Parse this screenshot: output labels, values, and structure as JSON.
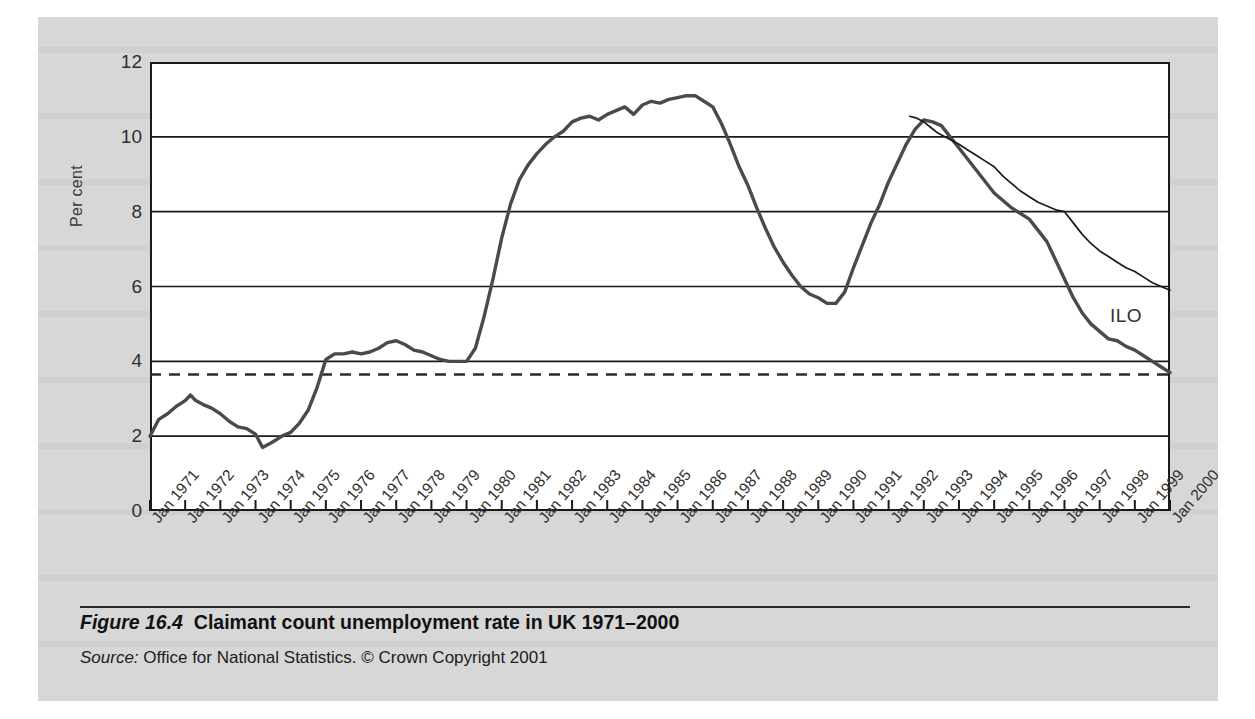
{
  "figure": {
    "number": "Figure 16.4",
    "title": "Claimant count unemployment rate in UK 1971–2000",
    "source_word": "Source:",
    "source_text": "Office for National Statistics. © Crown Copyright 2001"
  },
  "colors": {
    "panel_background": "#d7d7d7",
    "plot_background": "#ffffff",
    "axis": "#1a1a1a",
    "claimant_line": "#4a4a4a",
    "ilo_line": "#1a1a1a",
    "dashed_reference": "#2b2b2b"
  },
  "annotations": {
    "ilo_label": "ILO"
  },
  "chart_data": {
    "type": "line",
    "title": "Claimant count unemployment rate in UK 1971–2000",
    "xlabel": "",
    "ylabel": "Per cent",
    "ylim": [
      0,
      12
    ],
    "yticks": [
      0,
      2,
      4,
      6,
      8,
      10,
      12
    ],
    "ytick_labels": [
      "0",
      "2",
      "4",
      "6",
      "8",
      "10",
      "12"
    ],
    "grid": "horizontal",
    "legend_position": "inline-annotation",
    "xlim": [
      "Jan 1971",
      "Jan 2000"
    ],
    "categories": [
      "Jan 1971",
      "Jan 1972",
      "Jan 1973",
      "Jan 1974",
      "Jan 1975",
      "Jan 1976",
      "Jan 1977",
      "Jan 1978",
      "Jan 1979",
      "Jan 1980",
      "Jan 1981",
      "Jan 1982",
      "Jan 1983",
      "Jan 1984",
      "Jan 1985",
      "Jan 1986",
      "Jan 1987",
      "Jan 1988",
      "Jan 1989",
      "Jan 1990",
      "Jan 1991",
      "Jan 1992",
      "Jan 1993",
      "Jan 1994",
      "Jan 1995",
      "Jan 1996",
      "Jan 1997",
      "Jan 1998",
      "Jan 1999",
      "Jan 2000"
    ],
    "reference_line": {
      "label": "",
      "value": 3.65,
      "style": "dashed"
    },
    "series": [
      {
        "name": "Claimant count",
        "style": "solid-thick",
        "color": "#4a4a4a",
        "x": [
          1971.0,
          1971.25,
          1971.5,
          1971.75,
          1972.0,
          1972.15,
          1972.3,
          1972.5,
          1972.75,
          1973.0,
          1973.25,
          1973.5,
          1973.75,
          1974.0,
          1974.2,
          1974.5,
          1974.75,
          1975.0,
          1975.25,
          1975.5,
          1975.75,
          1976.0,
          1976.25,
          1976.5,
          1976.75,
          1977.0,
          1977.25,
          1977.5,
          1977.75,
          1978.0,
          1978.25,
          1978.5,
          1978.75,
          1979.0,
          1979.25,
          1979.5,
          1979.75,
          1980.0,
          1980.25,
          1980.5,
          1980.75,
          1981.0,
          1981.25,
          1981.5,
          1981.75,
          1982.0,
          1982.25,
          1982.5,
          1982.75,
          1983.0,
          1983.25,
          1983.5,
          1983.75,
          1984.0,
          1984.25,
          1984.5,
          1984.75,
          1985.0,
          1985.25,
          1985.5,
          1985.75,
          1986.0,
          1986.25,
          1986.5,
          1986.75,
          1987.0,
          1987.25,
          1987.5,
          1987.75,
          1988.0,
          1988.25,
          1988.5,
          1988.75,
          1989.0,
          1989.25,
          1989.5,
          1989.75,
          1990.0,
          1990.25,
          1990.5,
          1990.75,
          1991.0,
          1991.25,
          1991.5,
          1991.75,
          1992.0,
          1992.25,
          1992.5,
          1992.75,
          1993.0,
          1993.25,
          1993.5,
          1993.75,
          1994.0,
          1994.25,
          1994.5,
          1994.75,
          1995.0,
          1995.25,
          1995.5,
          1995.75,
          1996.0,
          1996.25,
          1996.5,
          1996.75,
          1997.0,
          1997.25,
          1997.5,
          1997.75,
          1998.0,
          1998.25,
          1998.5,
          1998.75,
          1999.0,
          1999.25,
          1999.5,
          1999.75,
          2000.0
        ],
        "y": [
          2.0,
          2.45,
          2.6,
          2.8,
          2.95,
          3.1,
          2.95,
          2.85,
          2.75,
          2.6,
          2.4,
          2.25,
          2.2,
          2.05,
          1.7,
          1.85,
          2.0,
          2.1,
          2.35,
          2.7,
          3.3,
          4.05,
          4.2,
          4.2,
          4.25,
          4.2,
          4.25,
          4.35,
          4.5,
          4.55,
          4.45,
          4.3,
          4.25,
          4.15,
          4.05,
          4.0,
          4.0,
          4.0,
          4.35,
          5.2,
          6.2,
          7.3,
          8.2,
          8.85,
          9.25,
          9.55,
          9.8,
          10.0,
          10.15,
          10.4,
          10.5,
          10.55,
          10.45,
          10.6,
          10.7,
          10.8,
          10.6,
          10.85,
          10.95,
          10.9,
          11.0,
          11.05,
          11.1,
          11.1,
          10.95,
          10.8,
          10.35,
          9.8,
          9.2,
          8.7,
          8.1,
          7.55,
          7.05,
          6.65,
          6.3,
          6.0,
          5.8,
          5.7,
          5.55,
          5.55,
          5.85,
          6.5,
          7.1,
          7.7,
          8.2,
          8.8,
          9.3,
          9.8,
          10.2,
          10.45,
          10.4,
          10.3,
          10.0,
          9.7,
          9.4,
          9.1,
          8.8,
          8.5,
          8.3,
          8.1,
          7.95,
          7.8,
          7.5,
          7.2,
          6.7,
          6.2,
          5.7,
          5.3,
          5.0,
          4.8,
          4.6,
          4.55,
          4.4,
          4.3,
          4.15,
          4.0,
          3.85,
          3.7
        ]
      },
      {
        "name": "ILO",
        "style": "solid-thin",
        "color": "#1a1a1a",
        "x": [
          1992.6,
          1992.8,
          1993.0,
          1993.2,
          1993.4,
          1993.6,
          1993.8,
          1994.0,
          1994.25,
          1994.5,
          1994.75,
          1995.0,
          1995.25,
          1995.5,
          1995.75,
          1996.0,
          1996.25,
          1996.5,
          1996.75,
          1997.0,
          1997.25,
          1997.5,
          1997.75,
          1998.0,
          1998.25,
          1998.5,
          1998.75,
          1999.0,
          1999.25,
          1999.5,
          1999.75,
          2000.0
        ],
        "y": [
          10.55,
          10.5,
          10.4,
          10.25,
          10.1,
          10.0,
          9.9,
          9.8,
          9.65,
          9.5,
          9.35,
          9.2,
          8.95,
          8.75,
          8.55,
          8.4,
          8.25,
          8.15,
          8.05,
          8.0,
          7.7,
          7.4,
          7.15,
          6.95,
          6.8,
          6.65,
          6.5,
          6.4,
          6.25,
          6.1,
          6.0,
          5.9
        ]
      }
    ]
  }
}
